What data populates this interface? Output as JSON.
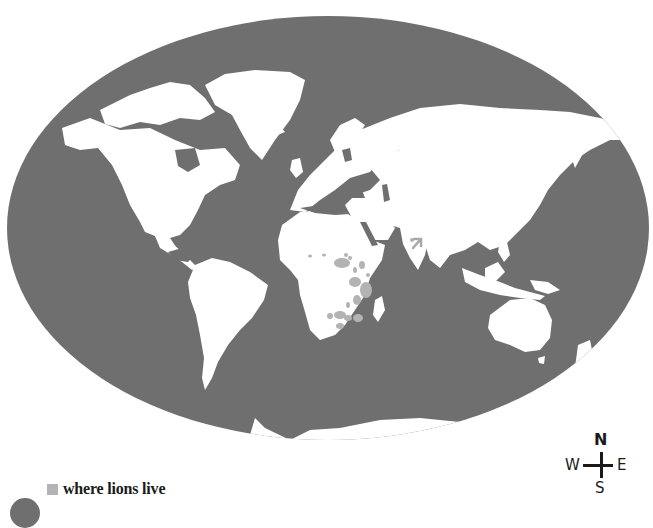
{
  "map": {
    "projection": "world-ellipse",
    "colors": {
      "ocean": "#6f6f6f",
      "land": "#ffffff",
      "lion_range": "#b3b3b3",
      "background": "#ffffff"
    },
    "highlight_region": "Africa (sub-Saharan) and western India (Gir)",
    "pointer_arrow": "points to lion range in western India"
  },
  "legend": {
    "swatch_color": "#b3b3b3",
    "label": "where lions live"
  },
  "compass": {
    "north": "N",
    "west": "W",
    "east": "E",
    "south": "S"
  }
}
